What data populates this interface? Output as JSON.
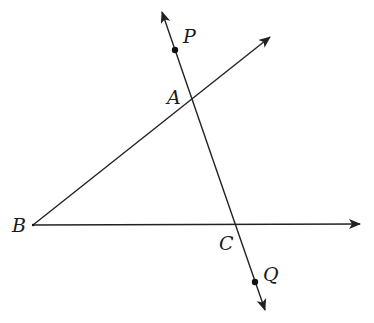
{
  "diagram": {
    "colors": {
      "stroke": "#222222",
      "label": "#1a1a1a",
      "background": "#ffffff"
    },
    "points": {
      "P": {
        "label": "P",
        "x": 175,
        "y": 50
      },
      "A": {
        "label": "A",
        "x": 190,
        "y": 95
      },
      "B": {
        "label": "B",
        "x": 33,
        "y": 225
      },
      "C": {
        "label": "C",
        "x": 235,
        "y": 225
      },
      "Q": {
        "label": "Q",
        "x": 255,
        "y": 282
      }
    },
    "lines": [
      {
        "name": "ray-BA",
        "from": "B",
        "through": "A",
        "arrow": "end"
      },
      {
        "name": "ray-BC",
        "from": "B",
        "through": "C",
        "arrow": "end"
      },
      {
        "name": "line-PQ",
        "through": [
          "P",
          "A",
          "C",
          "Q"
        ],
        "arrow": "both"
      }
    ]
  }
}
